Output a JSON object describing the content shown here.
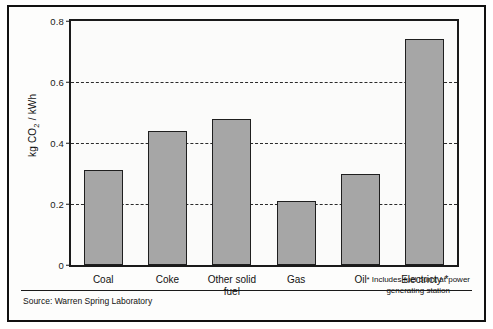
{
  "chart_data": {
    "type": "bar",
    "title": "",
    "subtitle": "",
    "xlabel": "",
    "ylabel": "kg CO2 / kWh",
    "ylabel_parts": {
      "prefix": "kg CO",
      "sub": "2",
      "suffix": " / kWh"
    },
    "categories": [
      "Coal",
      "Coke",
      "Other solid\nfuel",
      "Gas",
      "Oil",
      "Electricty *"
    ],
    "values": [
      0.31,
      0.44,
      0.48,
      0.21,
      0.3,
      0.74
    ],
    "ylim": [
      0,
      0.8
    ],
    "yticks": [
      0,
      0.2,
      0.4,
      0.6,
      0.8
    ],
    "ytick_labels": [
      "0",
      "0.2",
      "0.4",
      "0.6",
      "0.8"
    ],
    "gridlines": [
      0.2,
      0.4,
      0.6
    ],
    "grid": "horizontal-dashed",
    "legend": "none",
    "bar_color": "#a6a6a6",
    "bar_edge_color": "#1f1f1f",
    "axis_color": "#1a1a1a"
  },
  "annotations": {
    "source": "Source: Warren Spring Laboratory",
    "footnote": "* Includes fuel burnt at power\ngenerating station"
  }
}
